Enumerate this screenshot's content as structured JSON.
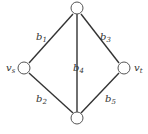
{
  "diagram": {
    "type": "graph",
    "nodes": [
      {
        "id": "top",
        "label": ""
      },
      {
        "id": "vs",
        "label": "v",
        "sub": "s"
      },
      {
        "id": "vt",
        "label": "v",
        "sub": "t"
      },
      {
        "id": "bottom",
        "label": ""
      }
    ],
    "edges": [
      {
        "id": "b1",
        "from": "vs",
        "to": "top",
        "label": "b",
        "sub": "1"
      },
      {
        "id": "b2",
        "from": "vs",
        "to": "bottom",
        "label": "b",
        "sub": "2"
      },
      {
        "id": "b3",
        "from": "top",
        "to": "vt",
        "label": "b",
        "sub": "3"
      },
      {
        "id": "b4",
        "from": "top",
        "to": "bottom",
        "label": "b",
        "sub": "4"
      },
      {
        "id": "b5",
        "from": "bottom",
        "to": "vt",
        "label": "b",
        "sub": "5"
      }
    ]
  }
}
